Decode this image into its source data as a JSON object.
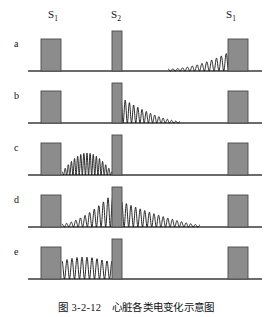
{
  "figure": {
    "caption": "图 3-2-12　心脏各类电变化示意图",
    "stimulus_labels": [
      {
        "name": "s1-left",
        "base": "S",
        "sub": "1",
        "x": 54
      },
      {
        "name": "s2-middle",
        "base": "S",
        "sub": "2",
        "x": 117
      },
      {
        "name": "s1-right",
        "base": "S",
        "sub": "1",
        "x": 232
      }
    ],
    "row_labels": [
      "a",
      "b",
      "c",
      "d",
      "e"
    ],
    "colors": {
      "block_fill": "#8c8c8c",
      "block_stroke": "#4a4a4a",
      "baseline": "#3a3a3a",
      "trace": "#111111",
      "text": "#111111",
      "background": "#ffffff"
    },
    "geometry": {
      "baseline_x_start": 28,
      "baseline_x_end": 262,
      "panel_height": 52,
      "block_s1_width": 20,
      "block_s1_height": 32,
      "block_s2_width": 10,
      "block_s2_height": 40,
      "s1_left_x": 41,
      "s2_x": 112,
      "s1_right_x": 228
    }
  },
  "chart_data": {
    "type": "line",
    "title": "图 3-2-12　心脏各类电变化示意图",
    "xlabel": "",
    "ylabel": "",
    "grid": false,
    "legend": "none",
    "panels": [
      {
        "id": "a",
        "label": "a",
        "description": "oscillation of growing amplitude approaching the right S1 stimulus",
        "envelope": "crescendo",
        "trace_x_start": 168,
        "trace_x_end": 231,
        "cycles": 13,
        "amp_start": 2,
        "amp_peak": 20,
        "blocks": [
          "S1",
          "S2",
          "S1"
        ]
      },
      {
        "id": "b",
        "label": "b",
        "description": "oscillation starting at maximum amplitude just right of S2 and decaying to the right",
        "envelope": "decrescendo",
        "trace_x_start": 121,
        "trace_x_end": 180,
        "cycles": 14,
        "amp_start": 24,
        "amp_peak": 24,
        "blocks": [
          "S1",
          "S2",
          "S1"
        ]
      },
      {
        "id": "c",
        "label": "c",
        "description": "spindle shaped burst between the left S1 and S2, rising then falling",
        "envelope": "spindle",
        "trace_x_start": 62,
        "trace_x_end": 112,
        "cycles": 16,
        "amp_start": 3,
        "amp_peak": 22,
        "blocks": [
          "S1",
          "S2",
          "S1"
        ]
      },
      {
        "id": "d",
        "label": "d",
        "description": "oscillation rising from the left S1 to a maximum at S2 then decaying toward the right S1",
        "envelope": "rise-to-s2-then-decay",
        "trace_x_start": 62,
        "trace_x_end": 200,
        "cycles": 30,
        "amp_start": 3,
        "amp_peak": 30,
        "blocks": [
          "S1",
          "S2",
          "S1"
        ]
      },
      {
        "id": "e",
        "label": "e",
        "description": "steady uniform amplitude oscillation between the left S1 and S2",
        "envelope": "constant",
        "trace_x_start": 62,
        "trace_x_end": 112,
        "cycles": 10,
        "amp_start": 22,
        "amp_peak": 22,
        "blocks": [
          "S1",
          "S2",
          "S1"
        ]
      }
    ]
  }
}
